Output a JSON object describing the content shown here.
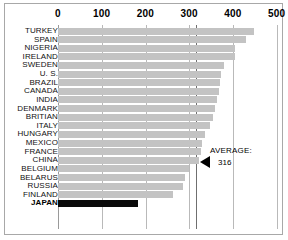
{
  "chart_data": {
    "type": "bar",
    "orientation": "horizontal",
    "title": "",
    "xlabel": "",
    "ylabel": "",
    "xlim": [
      0,
      500
    ],
    "xticks": [
      0,
      100,
      200,
      300,
      400,
      500
    ],
    "xtick_labels": [
      "0",
      "100",
      "200",
      "300",
      "400",
      "500"
    ],
    "grid": true,
    "legend": false,
    "categories": [
      "TURKEY",
      "SPAIN",
      "NIGERIA",
      "IRELAND",
      "SWEDEN",
      "U. S.",
      "BRAZIL",
      "CANADA",
      "INDIA",
      "DENMARK",
      "BRITIAN",
      "ITALY",
      "HUNGARY",
      "MEXICO",
      "FRANCE",
      "CHINA",
      "BELGIUM",
      "BELARUS",
      "RUSSIA",
      "FINLAND",
      "JAPAN"
    ],
    "values": [
      447,
      430,
      404,
      404,
      379,
      372,
      370,
      368,
      364,
      358,
      355,
      347,
      337,
      330,
      326,
      322,
      300,
      290,
      285,
      263,
      183
    ],
    "bar_color": "#c3c3c3",
    "highlight_color": "#0a0a0a",
    "highlight_category": "JAPAN",
    "annotations": [
      {
        "name": "average",
        "label": "AVERAGE:",
        "value": "316",
        "value_numeric": 316,
        "marker": "left-triangle"
      }
    ]
  },
  "axis": {
    "ticks": [
      {
        "label": "0",
        "value": 0
      },
      {
        "label": "100",
        "value": 100
      },
      {
        "label": "200",
        "value": 200
      },
      {
        "label": "300",
        "value": 300
      },
      {
        "label": "400",
        "value": 400
      },
      {
        "label": "500",
        "value": 500
      }
    ]
  },
  "rows": [
    {
      "label": "TURKEY",
      "value": 447
    },
    {
      "label": "SPAIN",
      "value": 430
    },
    {
      "label": "NIGERIA",
      "value": 404
    },
    {
      "label": "IRELAND",
      "value": 404
    },
    {
      "label": "SWEDEN",
      "value": 379
    },
    {
      "label": "U. S.",
      "value": 372
    },
    {
      "label": "BRAZIL",
      "value": 370
    },
    {
      "label": "CANADA",
      "value": 368
    },
    {
      "label": "INDIA",
      "value": 364
    },
    {
      "label": "DENMARK",
      "value": 358
    },
    {
      "label": "BRITIAN",
      "value": 355
    },
    {
      "label": "ITALY",
      "value": 347
    },
    {
      "label": "HUNGARY",
      "value": 337
    },
    {
      "label": "MEXICO",
      "value": 330
    },
    {
      "label": "FRANCE",
      "value": 326
    },
    {
      "label": "CHINA",
      "value": 322
    },
    {
      "label": "BELGIUM",
      "value": 300
    },
    {
      "label": "BELARUS",
      "value": 290
    },
    {
      "label": "RUSSIA",
      "value": 285
    },
    {
      "label": "FINLAND",
      "value": 263
    },
    {
      "label": "JAPAN",
      "value": 183
    }
  ],
  "average": {
    "label": "AVERAGE:",
    "value": "316"
  },
  "colors": {
    "bar": "#c3c3c3",
    "bar_highlight": "#0a0a0a",
    "gridline": "#b9b9b9",
    "frame": "#a8a8a8",
    "background": "#ffffff"
  }
}
